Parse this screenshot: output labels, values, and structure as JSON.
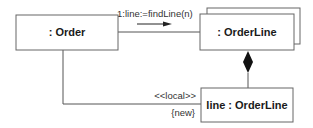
{
  "diagram": {
    "type": "uml-communication-diagram",
    "objects": [
      {
        "id": "order",
        "label": ": Order",
        "multi": false
      },
      {
        "id": "orderline-multi",
        "label": ": OrderLine",
        "multi": true
      },
      {
        "id": "line-orderline",
        "label": "line : OrderLine",
        "multi": false
      }
    ],
    "links": [
      {
        "from": "order",
        "to": "orderline-multi",
        "message": "1:line:=findLine(n)",
        "arrow": "right"
      },
      {
        "from": "orderline-multi",
        "to": "line-orderline",
        "kind": "composition"
      },
      {
        "from": "order",
        "to": "line-orderline",
        "stereotype": "<<local>>",
        "constraint": "{new}"
      }
    ],
    "colors": {
      "stroke": "#555555",
      "text": "#1a1a1a",
      "background": "#ffffff"
    }
  }
}
